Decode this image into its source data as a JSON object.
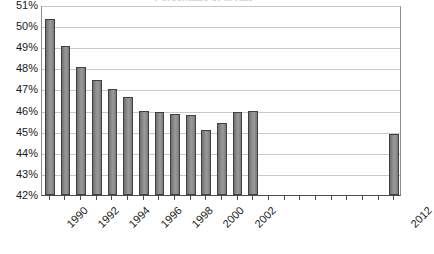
{
  "chart_data": {
    "type": "bar",
    "title": "Percentage of ... rate",
    "xlabel": "",
    "ylabel": "",
    "ylim": [
      42,
      51
    ],
    "ytick_values": [
      42,
      43,
      44,
      45,
      46,
      47,
      48,
      49,
      50,
      51
    ],
    "ytick_labels": [
      "42%",
      "43%",
      "44%",
      "45%",
      "46%",
      "47%",
      "48%",
      "49%",
      "50%",
      "51%"
    ],
    "grid": true,
    "legend": "none",
    "bar_color": "#8d8d8d",
    "bar_border_color": "#404040",
    "categories": [
      "1990",
      "1991",
      "1992",
      "1993",
      "1994",
      "1995",
      "1996",
      "1997",
      "1998",
      "1999",
      "2000",
      "2001",
      "2002",
      "2003",
      "2004",
      "2005",
      "2006",
      "2007",
      "2008",
      "2009",
      "2010",
      "2011",
      "2012"
    ],
    "xtick_labels": [
      "1990",
      "",
      "1992",
      "",
      "1994",
      "",
      "1996",
      "",
      "1998",
      "",
      "2000",
      "",
      "2002",
      "",
      "",
      "",
      "",
      "",
      "",
      "",
      "",
      "",
      "2012"
    ],
    "values": [
      50.35,
      49.05,
      48.05,
      47.45,
      47.0,
      46.65,
      46.0,
      45.95,
      45.85,
      45.8,
      45.1,
      45.4,
      45.95,
      46.0,
      null,
      null,
      null,
      null,
      null,
      null,
      null,
      null,
      44.9
    ],
    "value_labels": [
      "50.35%",
      "49.05%",
      "48.05%",
      "47.45%",
      "47.00%",
      "46.65%",
      "46.00%",
      "45.95%",
      "45.85%",
      "45.80%",
      "45.10%",
      "45.40%",
      "45.95%",
      "46.00%",
      "",
      "",
      "",
      "",
      "",
      "",
      "",
      "",
      "44.90%"
    ]
  }
}
